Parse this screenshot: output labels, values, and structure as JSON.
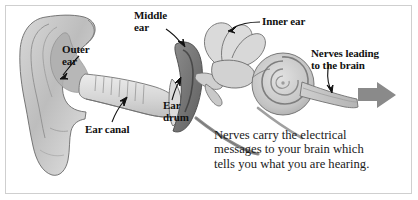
{
  "figure": {
    "background_color": "#ffffff",
    "frame_color": "#cfcfcf",
    "ink_color": "#111111",
    "arrow_color": "#8a8a8a"
  },
  "labels": {
    "outer_ear": "Outer\near",
    "middle_ear": "Middle\near",
    "inner_ear": "Inner ear",
    "nerves_to_brain": "Nerves leading\nto the brain",
    "ear_drum": "Ear\ndrum",
    "ear_canal": "Ear canal"
  },
  "caption": {
    "text": "Nerves carry the electrical\nmessages to your brain which\ntells you what you are hearing."
  },
  "parts": {
    "pinna": "outer-ear-pinna",
    "ear_canal": "ear-canal-tube",
    "ear_drum": "ear-drum-membrane",
    "middle_ear_cavity": "middle-ear-cavity",
    "ossicles": "ossicles-bones",
    "semicircular_canals": "semicircular-canals",
    "cochlea": "cochlea-spiral",
    "auditory_nerve": "auditory-nerve",
    "direction_arrow": "right-arrow-to-brain"
  }
}
